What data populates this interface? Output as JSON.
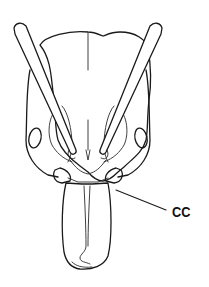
{
  "figure": {
    "labels": [
      {
        "id": "cc",
        "text": "CC",
        "points_to": "clypeal corner / base of mandible (right side)"
      }
    ],
    "colors": {
      "line": "#1a1a1a",
      "background": "#ffffff"
    }
  }
}
